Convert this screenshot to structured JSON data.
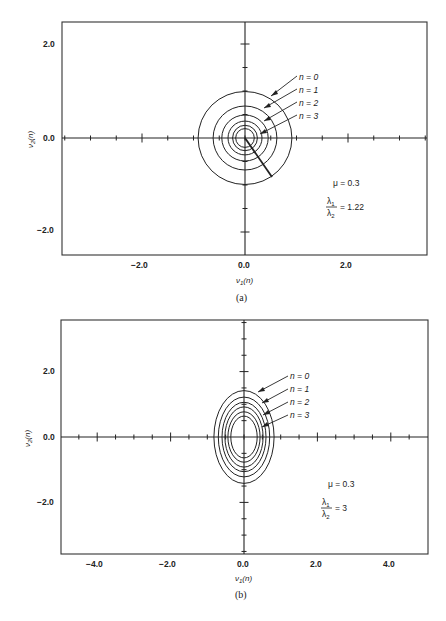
{
  "chart_data": [
    {
      "panel": "(a)",
      "type": "line",
      "title": "",
      "xlabel": "ν1(n)",
      "ylabel": "ν2(n)",
      "xlim": [
        -3.5,
        3.6
      ],
      "ylim": [
        -2.5,
        2.5
      ],
      "xticks_labeled": [
        -2.0,
        0.0,
        2.0
      ],
      "yticks_labeled": [
        -2.0,
        0.0,
        2.0
      ],
      "xtick_labels": [
        "−2.0",
        "0.0",
        "2.0"
      ],
      "ytick_labels": [
        "2.0",
        "0.0",
        "−2.0"
      ],
      "minor_tick_step": 0.5,
      "grid": false,
      "description": "Concentric contours of constant error (circles) for successive iterations n",
      "contours": [
        {
          "rx": 0.91,
          "ry": 0.99
        },
        {
          "rx": 0.62,
          "ry": 0.68
        },
        {
          "rx": 0.45,
          "ry": 0.49
        },
        {
          "rx": 0.33,
          "ry": 0.36
        },
        {
          "rx": 0.24,
          "ry": 0.27
        },
        {
          "rx": 0.18,
          "ry": 0.2
        }
      ],
      "trajectory": {
        "from": [
          0.0,
          0.0
        ],
        "to": [
          0.52,
          -0.83
        ]
      },
      "series_labels": [
        "n = 0",
        "n = 1",
        "n = 2",
        "n = 3"
      ],
      "annotations": {
        "mu": "μ = 0.3",
        "ratio_num": "λ1",
        "ratio_den": "λ2",
        "ratio_value": "= 1.22"
      },
      "mu": 0.3,
      "eigenvalue_ratio": 1.22
    },
    {
      "panel": "(b)",
      "type": "line",
      "title": "",
      "xlabel": "ν1(n)",
      "ylabel": "ν2(n)",
      "xlim": [
        -5.0,
        5.0
      ],
      "ylim": [
        -3.6,
        3.6
      ],
      "xticks_labeled": [
        -4.0,
        -2.0,
        0.0,
        2.0,
        4.0
      ],
      "yticks_labeled": [
        -2.0,
        0.0,
        2.0
      ],
      "xtick_labels": [
        "−4.0",
        "−2.0",
        "0.0",
        "2.0",
        "4.0"
      ],
      "ytick_labels": [
        "2.0",
        "0.0",
        "−2.0"
      ],
      "minor_tick_step": 0.5,
      "grid": false,
      "description": "Concentric elliptical contours for successive iterations n",
      "contours": [
        {
          "rx": 0.82,
          "ry": 1.42
        },
        {
          "rx": 0.7,
          "ry": 1.22
        },
        {
          "rx": 0.6,
          "ry": 1.06
        },
        {
          "rx": 0.52,
          "ry": 0.92
        },
        {
          "rx": 0.44,
          "ry": 0.77
        },
        {
          "rx": 0.36,
          "ry": 0.64
        }
      ],
      "series_labels": [
        "n = 0",
        "n = 1",
        "n = 2",
        "n = 3"
      ],
      "annotations": {
        "mu": "μ = 0.3",
        "ratio_num": "λ1",
        "ratio_den": "λ2",
        "ratio_value": "= 3"
      },
      "mu": 0.3,
      "eigenvalue_ratio": 3
    }
  ],
  "panels": {
    "a": {
      "caption": "(a)",
      "xlabel_sym": "ν",
      "xlabel_sub": "1",
      "xlabel_arg": "(n)",
      "ylabel_sym": "ν",
      "ylabel_sub": "2",
      "ylabel_arg": "(n)",
      "labels": [
        "n = 0",
        "n = 1",
        "n = 2",
        "n = 3"
      ],
      "mu": "μ = 0.3",
      "ratio_num": "λ",
      "ratio_num_sub": "1",
      "ratio_den": "λ",
      "ratio_den_sub": "2",
      "ratio_value": "= 1.22",
      "xticks": [
        "−2.0",
        "0.0",
        "2.0"
      ],
      "yticks": [
        "2.0",
        "0.0",
        "−2.0"
      ]
    },
    "b": {
      "caption": "(b)",
      "xlabel_sym": "ν",
      "xlabel_sub": "1",
      "xlabel_arg": "(n)",
      "ylabel_sym": "ν",
      "ylabel_sub": "2",
      "ylabel_arg": "(n)",
      "labels": [
        "n = 0",
        "n = 1",
        "n = 2",
        "n = 3"
      ],
      "mu": "μ = 0.3",
      "ratio_num": "λ",
      "ratio_num_sub": "1",
      "ratio_den": "λ",
      "ratio_den_sub": "2",
      "ratio_value": "= 3",
      "xticks": [
        "−4.0",
        "−2.0",
        "0.0",
        "2.0",
        "4.0"
      ],
      "yticks": [
        "2.0",
        "0.0",
        "−2.0"
      ]
    }
  }
}
